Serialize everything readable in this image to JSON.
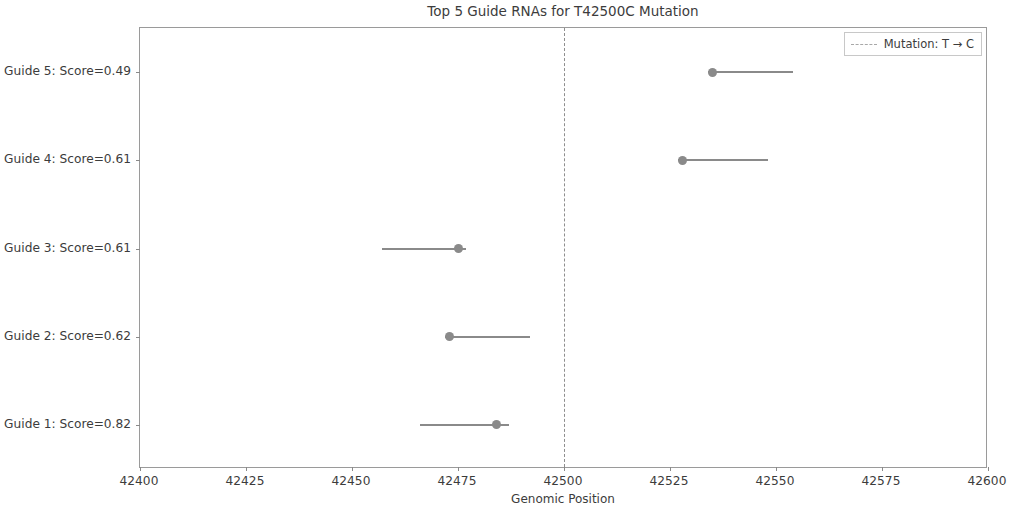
{
  "chart_data": {
    "type": "scatter",
    "title": "Top 5 Guide RNAs for T42500C Mutation",
    "xlabel": "Genomic Position",
    "ylabel": "",
    "xlim": [
      42400,
      42600
    ],
    "grid": false,
    "legend_position": "upper right",
    "xticks": [
      42400,
      42425,
      42450,
      42475,
      42500,
      42525,
      42550,
      42575,
      42600
    ],
    "xtick_labels": [
      "42400",
      "42425",
      "42450",
      "42475",
      "42500",
      "42525",
      "42550",
      "42575",
      "42600"
    ],
    "ytick_labels": [
      "Guide 1: Score=0.82",
      "Guide 2: Score=0.62",
      "Guide 3: Score=0.61",
      "Guide 4: Score=0.61",
      "Guide 5: Score=0.49"
    ],
    "categories": [
      "Guide 1: Score=0.82",
      "Guide 2: Score=0.62",
      "Guide 3: Score=0.61",
      "Guide 4: Score=0.61",
      "Guide 5: Score=0.49"
    ],
    "series": [
      {
        "name": "Guide RNA span",
        "marker_color": "#8a8a8a",
        "line_color": "#8a8a8a",
        "points": [
          {
            "label": "Guide 1: Score=0.82",
            "score": 0.82,
            "cut_site": 42484,
            "start": 42466,
            "end": 42487
          },
          {
            "label": "Guide 2: Score=0.62",
            "score": 0.62,
            "cut_site": 42473,
            "start": 42472,
            "end": 42492
          },
          {
            "label": "Guide 3: Score=0.61",
            "score": 0.61,
            "cut_site": 42475,
            "start": 42457,
            "end": 42477
          },
          {
            "label": "Guide 4: Score=0.61",
            "score": 0.61,
            "cut_site": 42528,
            "start": 42527,
            "end": 42548
          },
          {
            "label": "Guide 5: Score=0.49",
            "score": 0.49,
            "cut_site": 42535,
            "start": 42534,
            "end": 42554
          }
        ]
      }
    ],
    "annotations": [
      {
        "name": "mutation-line",
        "type": "vline",
        "x": 42500,
        "style": "dashed",
        "color": "#8e8e8e",
        "legend_label": "Mutation: T → C"
      }
    ],
    "legend": [
      {
        "label": "Mutation: T → C",
        "style": "dashed",
        "color": "#8e8e8e"
      }
    ]
  }
}
